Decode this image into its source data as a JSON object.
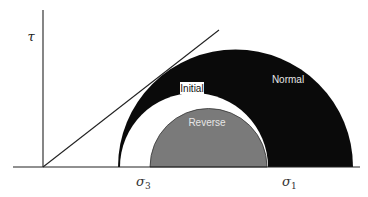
{
  "diagram": {
    "axis": {
      "y_label": "τ",
      "x_labels": [
        {
          "symbol": "σ",
          "subscript": "3"
        },
        {
          "symbol": "σ",
          "subscript": "1"
        }
      ]
    },
    "regions": [
      {
        "name": "normal",
        "label": "Normal",
        "color": "#0a0a0a"
      },
      {
        "name": "initial",
        "label": "Initial",
        "color": "#ffffff"
      },
      {
        "name": "reverse",
        "label": "Reverse",
        "color": "#7a7a7a"
      }
    ],
    "label_text_color": "#e6e6e6",
    "line_color": "#222222"
  }
}
